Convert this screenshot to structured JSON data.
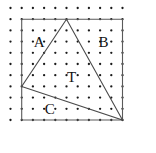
{
  "figure": {
    "type": "geometry-lattice-diagram",
    "canvas": {
      "width": 156,
      "height": 153,
      "background": "#ffffff"
    },
    "lattice": {
      "name": "dot-grid",
      "columns": 11,
      "rows": 11,
      "origin_x": 10.5,
      "origin_y": 8.0,
      "spacing_x": 11.2,
      "spacing_y": 11.2,
      "dot_radius": 1.15,
      "dot_color": "#1a1a1a"
    },
    "square": {
      "name": "bounding-square",
      "grid_points": [
        [
          1,
          1
        ],
        [
          10,
          1
        ],
        [
          10,
          10
        ],
        [
          1,
          10
        ]
      ],
      "stroke_color": "#5a5a5a",
      "stroke_width": 1.1
    },
    "triangle": {
      "name": "triangle-T",
      "grid_points": [
        [
          5,
          1
        ],
        [
          1,
          7
        ],
        [
          10,
          10
        ]
      ],
      "stroke_color": "#4a4a4a",
      "stroke_width": 1.1
    },
    "labels": [
      {
        "id": "label-A",
        "text": "A",
        "grid_x": 2.55,
        "grid_y": 3.2
      },
      {
        "id": "label-B",
        "text": "B",
        "grid_x": 8.3,
        "grid_y": 3.2
      },
      {
        "id": "label-T",
        "text": "T",
        "grid_x": 5.45,
        "grid_y": 6.3
      },
      {
        "id": "label-C",
        "text": "C",
        "grid_x": 3.5,
        "grid_y": 9.2
      }
    ]
  }
}
